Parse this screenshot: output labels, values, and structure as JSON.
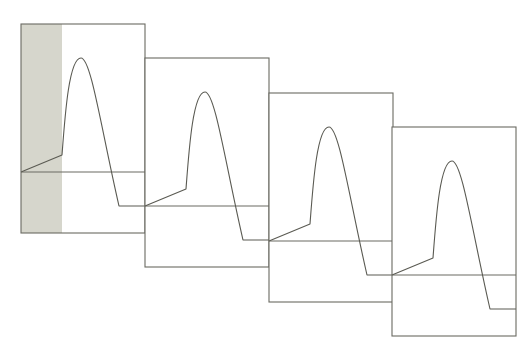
{
  "diagram": {
    "title": "",
    "panel_size": {
      "width": 124,
      "height": 209
    },
    "colors": {
      "line": "#6a6a62",
      "wave": "#5a5a52",
      "shade": "#d6d6cc",
      "background": "#ffffff"
    },
    "panels": [
      {
        "id": 1,
        "x": 21,
        "y": 24,
        "shaded": true,
        "shade_width": 41
      },
      {
        "id": 2,
        "x": 145,
        "y": 58,
        "shaded": false,
        "shade_width": 0
      },
      {
        "id": 3,
        "x": 269,
        "y": 93,
        "shaded": false,
        "shade_width": 0
      },
      {
        "id": 4,
        "x": 392,
        "y": 127,
        "shaded": false,
        "shade_width": 0
      }
    ],
    "waveform": {
      "baseline_offset": 148,
      "trough_offset": 182,
      "rise_start": [
        0,
        148
      ],
      "knee": [
        41,
        131
      ],
      "peak": [
        60,
        34
      ],
      "trough_start": [
        98,
        182
      ],
      "end": [
        124,
        182
      ]
    },
    "labels": []
  }
}
